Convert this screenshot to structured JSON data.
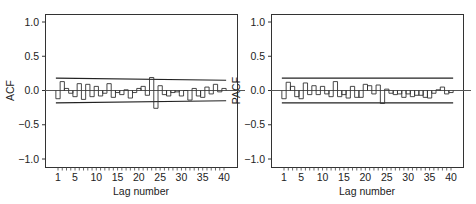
{
  "chart_data": [
    {
      "type": "bar",
      "style": "step",
      "title": "",
      "xlabel": "Lag number",
      "ylabel": "ACF",
      "ylim": [
        -1.1,
        1.1
      ],
      "yticks": [
        "1.0",
        "0.5",
        "0.0",
        "-0.5",
        "-1.0"
      ],
      "ytick_values": [
        1.0,
        0.5,
        0.0,
        -0.5,
        -1.0
      ],
      "xticks": [
        "1",
        "5",
        "10",
        "15",
        "20",
        "25",
        "30",
        "35",
        "40"
      ],
      "xtick_values": [
        1,
        5,
        10,
        15,
        20,
        25,
        30,
        35,
        40
      ],
      "grid": false,
      "categories": [
        1,
        2,
        3,
        4,
        5,
        6,
        7,
        8,
        9,
        10,
        11,
        12,
        13,
        14,
        15,
        16,
        17,
        18,
        19,
        20,
        21,
        22,
        23,
        24,
        25,
        26,
        27,
        28,
        29,
        30,
        31,
        32,
        33,
        34,
        35,
        36,
        37,
        38,
        39,
        40
      ],
      "values": [
        -0.12,
        0.13,
        0.03,
        -0.04,
        -0.09,
        0.1,
        -0.13,
        0.09,
        -0.09,
        0.06,
        -0.08,
        -0.04,
        0.1,
        -0.1,
        -0.03,
        -0.06,
        0.01,
        -0.11,
        -0.03,
        0.03,
        0.06,
        -0.07,
        0.19,
        -0.26,
        0.07,
        -0.06,
        -0.08,
        -0.03,
        -0.02,
        -0.08,
        0.0,
        -0.14,
        0.03,
        -0.08,
        -0.1,
        0.05,
        -0.05,
        0.09,
        -0.02,
        0.03
      ],
      "confidence_upper": {
        "start": 0.18,
        "end": 0.15
      },
      "confidence_lower": {
        "start": -0.18,
        "end": -0.15
      }
    },
    {
      "type": "bar",
      "style": "step",
      "title": "",
      "xlabel": "Lag number",
      "ylabel": "PACF",
      "ylim": [
        -1.1,
        1.1
      ],
      "yticks": [
        "1.0",
        "0.5",
        "0.0",
        "-0.5",
        "-1.0"
      ],
      "ytick_values": [
        1.0,
        0.5,
        0.0,
        -0.5,
        -1.0
      ],
      "xticks": [
        "1",
        "5",
        "10",
        "15",
        "20",
        "25",
        "30",
        "35",
        "40"
      ],
      "xtick_values": [
        1,
        5,
        10,
        15,
        20,
        25,
        30,
        35,
        40
      ],
      "grid": false,
      "categories": [
        1,
        2,
        3,
        4,
        5,
        6,
        7,
        8,
        9,
        10,
        11,
        12,
        13,
        14,
        15,
        16,
        17,
        18,
        19,
        20,
        21,
        22,
        23,
        24,
        25,
        26,
        27,
        28,
        29,
        30,
        31,
        32,
        33,
        34,
        35,
        36,
        37,
        38,
        39,
        40
      ],
      "values": [
        -0.12,
        0.12,
        0.06,
        -0.09,
        -0.12,
        0.11,
        -0.06,
        0.07,
        -0.06,
        0.06,
        -0.05,
        -0.09,
        0.13,
        -0.09,
        -0.06,
        -0.11,
        0.06,
        -0.1,
        -0.1,
        0.09,
        0.07,
        -0.05,
        0.08,
        -0.19,
        0.02,
        -0.04,
        -0.06,
        -0.05,
        -0.1,
        -0.05,
        -0.09,
        -0.07,
        -0.07,
        -0.1,
        -0.11,
        -0.04,
        0.01,
        0.05,
        -0.05,
        -0.03
      ],
      "confidence_upper": {
        "start": 0.18,
        "end": 0.18
      },
      "confidence_lower": {
        "start": -0.18,
        "end": -0.18
      }
    }
  ],
  "panels": [
    {
      "id": "acf",
      "ylabel": "ACF",
      "xlabel": "Lag number"
    },
    {
      "id": "pacf",
      "ylabel": "PACF",
      "xlabel": "Lag number"
    }
  ]
}
